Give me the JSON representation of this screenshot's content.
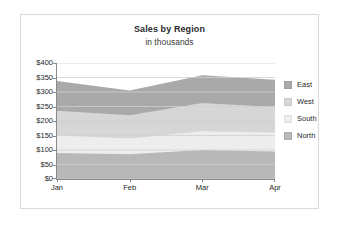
{
  "chart_data": {
    "type": "area",
    "stacked": true,
    "title": "Sales by Region",
    "subtitle": "in thousands",
    "xlabel": "",
    "ylabel": "",
    "categories": [
      "Jan",
      "Feb",
      "Mar",
      "Apr"
    ],
    "ylim": [
      0,
      400
    ],
    "ytick_step": 50,
    "ytick_labels": [
      "$400",
      "$350",
      "$300",
      "$250",
      "$200",
      "$150",
      "$100",
      "$50",
      "$0"
    ],
    "ytick_values": [
      400,
      350,
      300,
      250,
      200,
      150,
      100,
      50,
      0
    ],
    "grid": true,
    "grid_orientation": "horizontal",
    "legend_position": "right",
    "stack_order_bottom_to_top": [
      "North",
      "South",
      "West",
      "East"
    ],
    "series": [
      {
        "name": "East",
        "values": [
          103,
          85,
          96,
          94
        ],
        "color": "#a9a9a9",
        "cumulative_top": [
          338,
          305,
          358,
          342
        ]
      },
      {
        "name": "West",
        "values": [
          85,
          80,
          97,
          88
        ],
        "color": "#d6d6d6",
        "cumulative_top": [
          235,
          220,
          262,
          248
        ]
      },
      {
        "name": "South",
        "values": [
          60,
          55,
          65,
          65
        ],
        "color": "#ededed",
        "cumulative_top": [
          150,
          140,
          165,
          160
        ]
      },
      {
        "name": "North",
        "values": [
          90,
          85,
          100,
          95
        ],
        "color": "#b8b8b8",
        "cumulative_top": [
          90,
          85,
          100,
          95
        ]
      }
    ]
  },
  "legend": {
    "items": [
      {
        "label": "East",
        "color": "#a9a9a9"
      },
      {
        "label": "West",
        "color": "#d6d6d6"
      },
      {
        "label": "South",
        "color": "#ededed"
      },
      {
        "label": "North",
        "color": "#b8b8b8"
      }
    ]
  },
  "style": {
    "axis_color": "#8a8a8a",
    "grid_color": "#cfcfcf",
    "frame_color": "#d9d9d9",
    "text_color": "#1f1f1f",
    "background": "#ffffff"
  }
}
